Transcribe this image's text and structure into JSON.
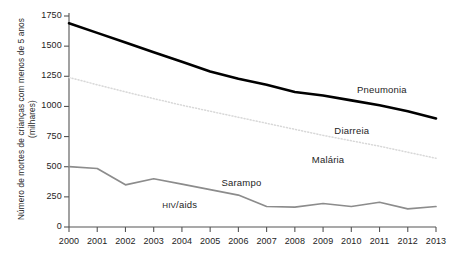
{
  "chart_data": {
    "type": "line",
    "title": "",
    "xlabel": "",
    "ylabel": "Número de mortes de crianças com menos de 5 anos (milhares)",
    "categories": [
      "2000",
      "2001",
      "2002",
      "2003",
      "2004",
      "2005",
      "2006",
      "2007",
      "2008",
      "2009",
      "2010",
      "2011",
      "2012",
      "2013"
    ],
    "x": [
      2000,
      2001,
      2002,
      2003,
      2004,
      2005,
      2006,
      2007,
      2008,
      2009,
      2010,
      2011,
      2012,
      2013
    ],
    "ylim": [
      0,
      1750
    ],
    "xlim": [
      2000,
      2013
    ],
    "yticks": [
      0,
      250,
      500,
      750,
      1000,
      1250,
      1500,
      1750
    ],
    "ytick_labels": [
      "0",
      "250",
      "500",
      "750",
      "1000",
      "1250",
      "1500",
      "1750"
    ],
    "grid": false,
    "legend": "inline-labels",
    "series": [
      {
        "name": "Pneumonia",
        "style": "solid-thick",
        "color": "#000000",
        "values": [
          1690,
          1610,
          1530,
          1450,
          1370,
          1290,
          1230,
          1180,
          1120,
          1090,
          1050,
          1010,
          960,
          900
        ]
      },
      {
        "name": "Diarreia",
        "style": "dotted-light",
        "color": "#d8d8d8",
        "values": [
          1240,
          1180,
          1120,
          1065,
          1010,
          960,
          910,
          860,
          810,
          760,
          715,
          670,
          620,
          570
        ]
      },
      {
        "name": "Sarampo",
        "style": "solid-medium",
        "color": "#8c8c8c",
        "values": [
          500,
          485,
          350,
          400,
          355,
          310,
          265,
          170,
          165,
          195,
          170,
          205,
          150,
          170
        ]
      }
    ],
    "annotations": [
      {
        "text": "Pneumonia",
        "x": 2010.2,
        "y": 1130
      },
      {
        "text": "Diarreia",
        "x": 2009.4,
        "y": 790
      },
      {
        "text": "Malária",
        "x": 2008.6,
        "y": 545
      },
      {
        "text": "Sarampo",
        "x": 2005.4,
        "y": 355
      },
      {
        "text": "HIV/aids",
        "x": 2003.3,
        "y": 175
      }
    ]
  },
  "axis": {
    "y_title": "Número de mortes de crianças com menos de 5 anos (milhares)",
    "y_ticks": [
      "1750",
      "1500",
      "1250",
      "1000",
      "750",
      "500",
      "250",
      "0"
    ],
    "x_ticks": [
      "2000",
      "2001",
      "2002",
      "2003",
      "2004",
      "2005",
      "2006",
      "2007",
      "2008",
      "2009",
      "2010",
      "2011",
      "2012",
      "2013"
    ]
  },
  "labels": {
    "pneumonia": "Pneumonia",
    "diarreia": "Diarreia",
    "malaria": "Malária",
    "sarampo": "Sarampo",
    "hivaids_head": "HIV",
    "hivaids_tail": "/aids"
  },
  "colors": {
    "pneumonia": "#000000",
    "diarreia": "#dcdcdc",
    "sarampo": "#8c8c8c",
    "axis": "#555555",
    "text": "#1d1d1d"
  }
}
